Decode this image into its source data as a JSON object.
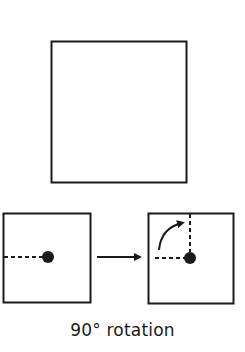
{
  "caption": "90° rotation",
  "colors": {
    "stroke": "#1a1a1a",
    "background": "#ffffff"
  },
  "figures": {
    "large_square": {
      "x": 51,
      "y": 41,
      "size": 136
    },
    "before_square": {
      "x": 3,
      "y": 213,
      "size": 88,
      "pivot": [
        48,
        257
      ]
    },
    "transition_arrow": {
      "from": [
        97,
        257
      ],
      "to": [
        142,
        257
      ]
    },
    "after_square": {
      "x": 148,
      "y": 213,
      "size": 86,
      "pivot": [
        190,
        258
      ],
      "rotation_degrees": 90
    }
  }
}
